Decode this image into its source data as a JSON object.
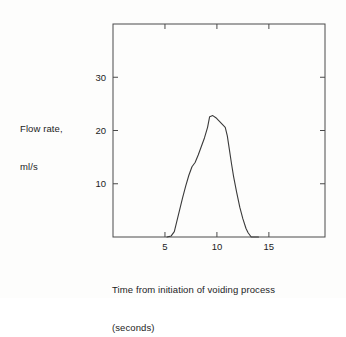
{
  "figure": {
    "background_color": "#fdfdfc",
    "line_color": "#3a3a3a",
    "axis_color": "#4a4a4a"
  },
  "labels": {
    "y_title_line1": "Flow rate,",
    "y_title_line2": "ml/s",
    "x_title_line1": "Time from initiation of voiding process",
    "x_title_line2": "(seconds)"
  },
  "chart_data": {
    "type": "line",
    "title": "",
    "xlabel": "Time from initiation of voiding process (seconds)",
    "ylabel": "Flow rate, ml/s",
    "xlim": [
      0,
      20.4
    ],
    "ylim": [
      0,
      40
    ],
    "xticks": [
      5,
      10,
      15
    ],
    "xtick_labels": [
      "5",
      "10",
      "15"
    ],
    "yticks": [
      10,
      20,
      30
    ],
    "ytick_labels": [
      "10",
      "20",
      "30"
    ],
    "grid": false,
    "legend": null,
    "box_frame": true,
    "ticks_inward_all_sides": true,
    "series": [
      {
        "name": "Urine flow rate",
        "x": [
          5.2,
          5.6,
          5.9,
          6.1,
          6.4,
          6.7,
          7.0,
          7.3,
          7.6,
          7.9,
          8.2,
          8.5,
          8.8,
          9.1,
          9.3,
          9.6,
          9.9,
          10.2,
          10.5,
          10.8,
          11.0,
          11.2,
          11.4,
          11.6,
          11.9,
          12.2,
          12.5,
          12.8,
          13.0,
          13.3,
          14.0
        ],
        "y": [
          0.0,
          0.2,
          1.0,
          2.6,
          5.0,
          7.4,
          9.6,
          11.6,
          13.2,
          14.0,
          15.4,
          17.0,
          18.6,
          20.6,
          22.6,
          22.8,
          22.4,
          21.8,
          21.2,
          20.6,
          19.0,
          16.4,
          13.8,
          11.4,
          8.4,
          5.6,
          3.4,
          1.6,
          0.8,
          0.0,
          0.0
        ]
      }
    ]
  }
}
